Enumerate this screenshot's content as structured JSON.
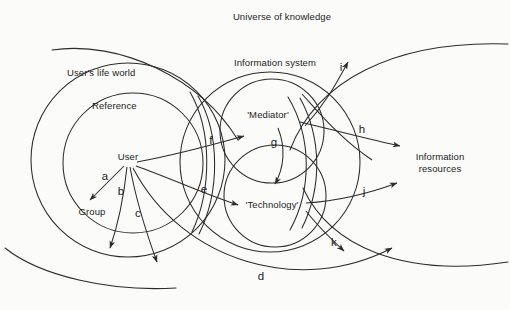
{
  "figure": {
    "type": "venn-circles-diagram",
    "background_color": "#fbfbfa",
    "stroke_color": "#2b2b2b"
  },
  "regions": {
    "universe": "Universe of knowledge",
    "user_life_world": "User's life world",
    "information_system": "Information system",
    "information_resources": "Information\nresources"
  },
  "nodes": {
    "reference": "Reference",
    "user": "User",
    "group": "Group",
    "mediator": "'Mediator'",
    "technology": "'Technology'"
  },
  "arrow_labels": {
    "a": "a",
    "b": "b",
    "c": "c",
    "d": "d",
    "e": "e",
    "f": "f",
    "g": "g",
    "h": "h",
    "i": "i",
    "j": "j",
    "k": "k"
  }
}
